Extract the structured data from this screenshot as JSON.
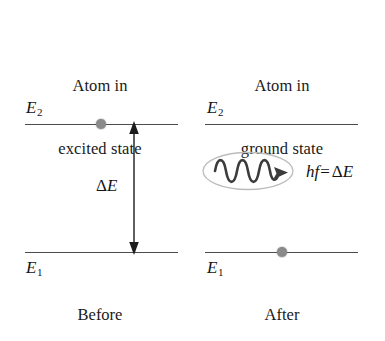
{
  "figure": {
    "kind": "energy-level-transition-diagram",
    "background_color": "#ffffff",
    "line_color": "#4c4c4c",
    "electron_color": "#8a8a8a",
    "ellipse_stroke_color": "#b9b9b9",
    "wave_color": "#3c3c3c",
    "text_color": "#141414"
  },
  "panels": {
    "left": {
      "title_line1": "Atom in",
      "title_line2": "excited state",
      "caption": "Before",
      "upper_level_label": "E",
      "upper_level_subscript": "2",
      "lower_level_label": "E",
      "lower_level_subscript": "1",
      "electron_on_level": "E2"
    },
    "right": {
      "title_line1": "Atom in",
      "title_line2": "ground state",
      "caption": "After",
      "upper_level_label": "E",
      "upper_level_subscript": "2",
      "lower_level_label": "E",
      "lower_level_subscript": "1",
      "electron_on_level": "E1"
    }
  },
  "annotations": {
    "energy_gap_delta": "Δ",
    "energy_gap_symbol": "E",
    "photon_h": "h",
    "photon_f": "f",
    "equals_sign": "=",
    "photon_delta": "Δ",
    "photon_energy_symbol": "E",
    "wave_cycles": 3.5
  }
}
